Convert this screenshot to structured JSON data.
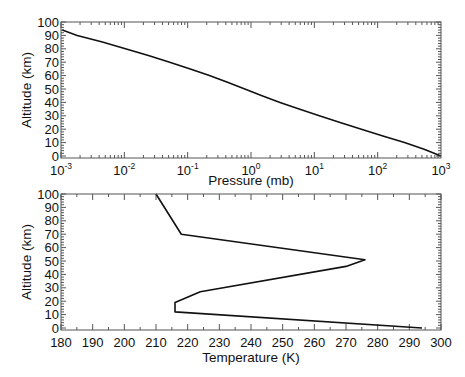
{
  "chart_data": [
    {
      "type": "line",
      "title": "",
      "xlabel": "Pressure (mb)",
      "ylabel": "Altitude (km)",
      "xscale": "log",
      "xlim": [
        0.001,
        1000
      ],
      "ylim": [
        0,
        100
      ],
      "xticks": [
        "10^-3",
        "10^-2",
        "10^-1",
        "10^0",
        "10^1",
        "10^2",
        "10^3"
      ],
      "xtick_exponents": [
        "-3",
        "-2",
        "-1",
        "0",
        "1",
        "2",
        "3"
      ],
      "yticks": [
        0,
        10,
        20,
        30,
        40,
        50,
        60,
        70,
        80,
        90,
        100
      ],
      "grid": false,
      "legend": null,
      "series": [
        {
          "name": "Pressure profile",
          "x": [
            1013,
            540,
            265,
            121,
            55.3,
            25.5,
            12.0,
            5.75,
            2.87,
            1.49,
            0.798,
            0.425,
            0.22,
            0.11,
            0.052,
            0.024,
            0.0104,
            0.0045,
            0.0018,
            0.00105
          ],
          "y": [
            0,
            5,
            10,
            15,
            20,
            25,
            30,
            35,
            40,
            45,
            50,
            55,
            60,
            65,
            70,
            75,
            80,
            85,
            90,
            94
          ]
        }
      ]
    },
    {
      "type": "line",
      "title": "",
      "xlabel": "Temperature (K)",
      "ylabel": "Altitude (km)",
      "xlim": [
        180,
        300
      ],
      "ylim": [
        0,
        100
      ],
      "xticks": [
        180,
        190,
        200,
        210,
        220,
        230,
        240,
        250,
        260,
        270,
        280,
        290,
        300
      ],
      "yticks": [
        0,
        10,
        20,
        30,
        40,
        50,
        60,
        70,
        80,
        90,
        100
      ],
      "grid": false,
      "legend": null,
      "series": [
        {
          "name": "Temperature profile",
          "x": [
            294,
            216,
            216,
            224,
            270,
            276,
            218,
            210
          ],
          "y": [
            0,
            12,
            19,
            27,
            46,
            51,
            70,
            100
          ]
        }
      ]
    }
  ],
  "axes": {
    "top": {
      "xlabel": "Pressure (mb)",
      "ylabel": "Altitude (km)",
      "xtick_base": "10"
    },
    "bottom": {
      "xlabel": "Temperature (K)",
      "ylabel": "Altitude (km)"
    }
  }
}
